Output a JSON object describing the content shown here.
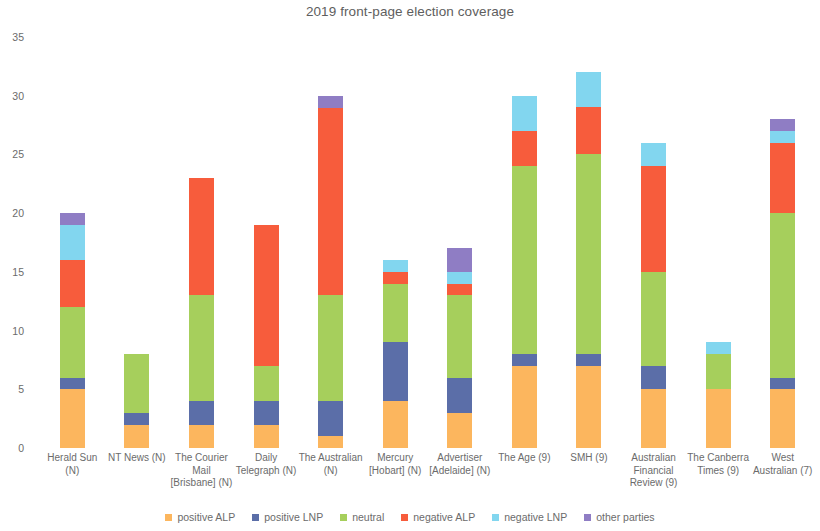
{
  "chart_data": {
    "type": "bar",
    "subtype": "stacked-bar",
    "title": "2019 front-page election coverage",
    "xlabel": "",
    "ylabel": "",
    "ylim": [
      0,
      35
    ],
    "ytick_values": [
      0,
      5,
      10,
      15,
      20,
      25,
      30,
      35
    ],
    "ytick_labels": [
      "0",
      "5",
      "10",
      "15",
      "20",
      "25",
      "30",
      "35"
    ],
    "grid": false,
    "legend_position": "bottom",
    "categories": [
      "Herald Sun (N)",
      "NT News (N)",
      "The Courier Mail [Brisbane] (N)",
      "Daily Telegraph (N)",
      "The Australian (N)",
      "Mercury [Hobart] (N)",
      "Advertiser [Adelaide] (N)",
      "The Age (9)",
      "SMH (9)",
      "Australian Financial Review (9)",
      "The Canberra Times (9)",
      "West Australian (7)"
    ],
    "series": [
      {
        "name": "positive ALP",
        "color": "#fcb65e",
        "values": [
          5,
          2,
          2,
          2,
          1,
          4,
          3,
          7,
          7,
          5,
          5,
          5
        ]
      },
      {
        "name": "positive LNP",
        "color": "#5b6ea8",
        "values": [
          1,
          1,
          2,
          2,
          3,
          5,
          3,
          1,
          1,
          2,
          0,
          1
        ]
      },
      {
        "name": "neutral",
        "color": "#a6cf5c",
        "values": [
          6,
          5,
          9,
          3,
          9,
          5,
          7,
          16,
          17,
          8,
          3,
          14
        ]
      },
      {
        "name": "negative ALP",
        "color": "#f75c3c",
        "values": [
          4,
          0,
          10,
          12,
          16,
          1,
          1,
          3,
          4,
          9,
          0,
          6
        ]
      },
      {
        "name": "negative LNP",
        "color": "#82d6ef",
        "values": [
          3,
          0,
          0,
          0,
          0,
          1,
          1,
          3,
          3,
          2,
          1,
          1
        ]
      },
      {
        "name": "other parties",
        "color": "#8f7dc4",
        "values": [
          1,
          0,
          0,
          0,
          1,
          0,
          2,
          0,
          0,
          0,
          0,
          1
        ]
      }
    ],
    "totals": [
      20,
      8,
      23,
      19,
      30,
      16,
      17,
      30,
      32,
      26,
      9,
      28
    ]
  },
  "legend": {
    "items": [
      {
        "label": "positive ALP",
        "color": "#fcb65e"
      },
      {
        "label": "positive LNP",
        "color": "#5b6ea8"
      },
      {
        "label": "neutral",
        "color": "#a6cf5c"
      },
      {
        "label": "negative ALP",
        "color": "#f75c3c"
      },
      {
        "label": "negative LNP",
        "color": "#82d6ef"
      },
      {
        "label": "other parties",
        "color": "#8f7dc4"
      }
    ]
  }
}
